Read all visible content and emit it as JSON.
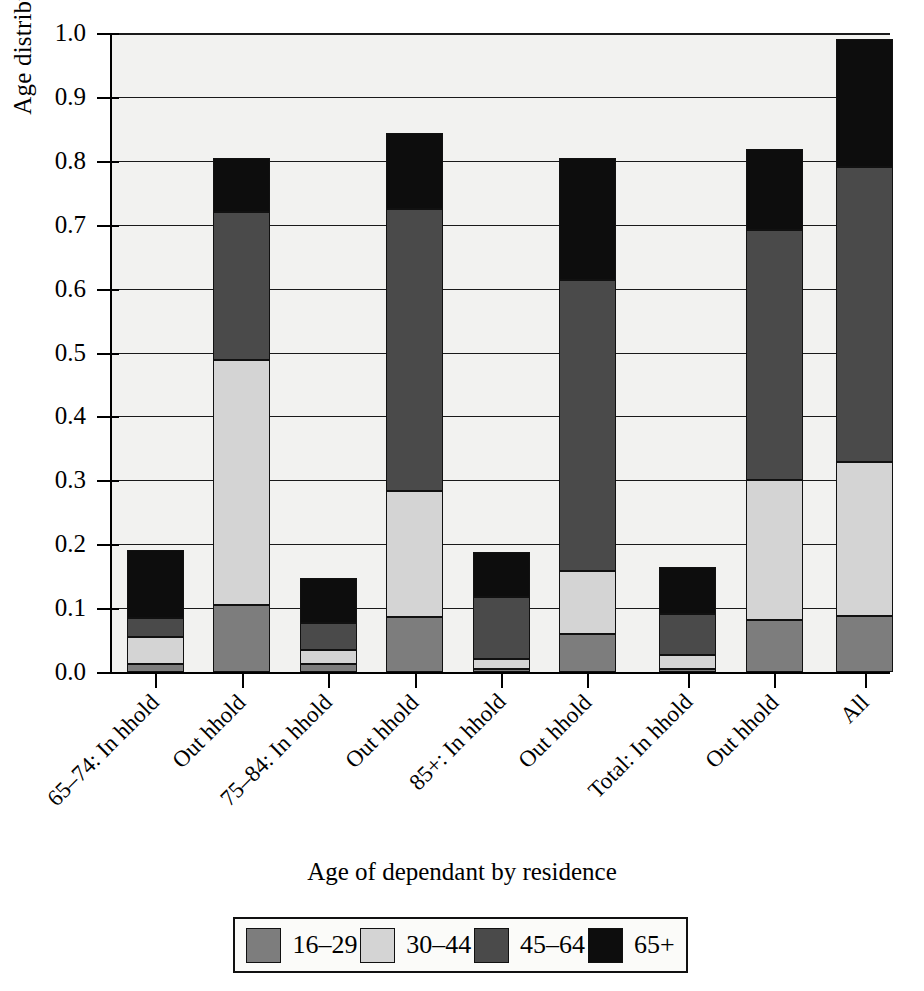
{
  "chart_data": {
    "type": "bar",
    "stacked": true,
    "title": "",
    "xlabel": "Age of dependant by residence",
    "ylabel": "Age distribution of carers",
    "ylim": [
      0.0,
      1.0
    ],
    "ytick_labels": [
      "0.0",
      "0.1",
      "0.2",
      "0.3",
      "0.4",
      "0.5",
      "0.6",
      "0.7",
      "0.8",
      "0.9",
      "1.0"
    ],
    "ytick_values": [
      0.0,
      0.1,
      0.2,
      0.3,
      0.4,
      0.5,
      0.6,
      0.7,
      0.8,
      0.9,
      1.0
    ],
    "grid": true,
    "legend_position": "bottom",
    "categories": [
      "65–74: In hhold",
      "Out hhold",
      "75–84: In hhold",
      "Out hhold",
      "85+: In hhold",
      "Out hhold",
      "Total: In hhold",
      "Out hhold",
      "All"
    ],
    "series": [
      {
        "name": "16–29",
        "color": "#7d7d7d",
        "values": [
          0.012,
          0.105,
          0.013,
          0.086,
          0.005,
          0.06,
          0.005,
          0.082,
          0.088
        ]
      },
      {
        "name": "30–44",
        "color": "#d4d4d4",
        "values": [
          0.043,
          0.384,
          0.021,
          0.198,
          0.015,
          0.098,
          0.022,
          0.218,
          0.24
        ]
      },
      {
        "name": "45–64",
        "color": "#4a4a4a",
        "values": [
          0.03,
          0.231,
          0.042,
          0.44,
          0.098,
          0.455,
          0.064,
          0.392,
          0.462
        ]
      },
      {
        "name": "65+",
        "color": "#0d0d0d",
        "values": [
          0.106,
          0.085,
          0.071,
          0.12,
          0.07,
          0.192,
          0.074,
          0.126,
          0.2
        ]
      }
    ],
    "stack_tops": [
      [
        0.012,
        0.055,
        0.085,
        0.191
      ],
      [
        0.105,
        0.489,
        0.72,
        0.805
      ],
      [
        0.013,
        0.034,
        0.076,
        0.147
      ],
      [
        0.086,
        0.284,
        0.724,
        0.844
      ],
      [
        0.005,
        0.02,
        0.118,
        0.188
      ],
      [
        0.06,
        0.158,
        0.613,
        0.805
      ],
      [
        0.005,
        0.027,
        0.091,
        0.165
      ],
      [
        0.082,
        0.3,
        0.692,
        0.818
      ],
      [
        0.088,
        0.328,
        0.79,
        0.99
      ]
    ]
  },
  "legend": {
    "items": [
      {
        "label": "16–29"
      },
      {
        "label": "30–44"
      },
      {
        "label": "45–64"
      },
      {
        "label": "65+"
      }
    ]
  }
}
